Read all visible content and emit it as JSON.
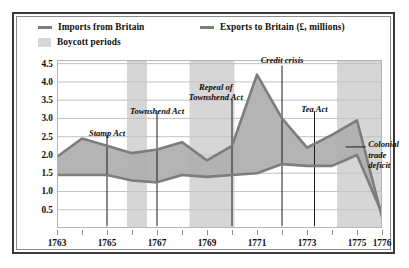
{
  "legend": {
    "imports_label": "Imports from Britain",
    "exports_label": "Exports to Britain (£, millions)",
    "boycott_label": "Boycott periods",
    "line_color": "#7d7d7d",
    "band_color": "#d6d6d6"
  },
  "annotations": [
    {
      "id": "stamp-act",
      "text": "Stamp Act"
    },
    {
      "id": "townshend-act",
      "text": "Townshend Act"
    },
    {
      "id": "repeal-line1",
      "text": "Repeal of"
    },
    {
      "id": "repeal-line2",
      "text": "Townshend Act"
    },
    {
      "id": "credit-crisis",
      "text": "Credit crisis"
    },
    {
      "id": "tea-act",
      "text": "Tea Act"
    },
    {
      "id": "colonial-line1",
      "text": "Colonial"
    },
    {
      "id": "colonial-line2",
      "text": "trade"
    },
    {
      "id": "colonial-line3",
      "text": "deficit"
    }
  ],
  "chart_data": {
    "type": "area",
    "title": "",
    "xlabel": "",
    "ylabel": "",
    "xlim": [
      1763,
      1776
    ],
    "ylim": [
      0,
      4.6
    ],
    "grid": true,
    "legend_position": "top",
    "x": [
      1763,
      1764,
      1765,
      1766,
      1767,
      1768,
      1769,
      1770,
      1771,
      1772,
      1773,
      1774,
      1775,
      1776
    ],
    "series": [
      {
        "name": "Imports from Britain",
        "color": "#7d7d7d",
        "values": [
          1.95,
          2.45,
          2.25,
          2.05,
          2.15,
          2.35,
          1.85,
          2.25,
          4.2,
          3.0,
          2.2,
          2.55,
          2.95,
          0.3
        ]
      },
      {
        "name": "Exports to Britain (£, millions)",
        "color": "#7d7d7d",
        "values": [
          1.45,
          1.45,
          1.45,
          1.3,
          1.25,
          1.45,
          1.4,
          1.45,
          1.5,
          1.75,
          1.7,
          1.7,
          2.0,
          0.4
        ]
      }
    ],
    "fill_between_color": "#b0b0b0",
    "y_ticks": [
      0.5,
      1.0,
      1.5,
      2.0,
      2.5,
      3.0,
      3.5,
      4.0,
      4.5
    ],
    "y_tick_labels": [
      "0.5",
      "1.0",
      "1.5",
      "2.0",
      "2.5",
      "3.0",
      "3.5",
      "4.0",
      "4.5"
    ],
    "x_ticks": [
      1763,
      1765,
      1767,
      1769,
      1771,
      1773,
      1775,
      1776
    ],
    "x_tick_labels": [
      "1763",
      "1765",
      "1767",
      "1769",
      "1771",
      "1773",
      "1775",
      "1776"
    ],
    "x_minor_ticks": [
      1764,
      1766,
      1768,
      1770,
      1772,
      1774
    ],
    "boycott_periods": [
      {
        "start": 1765.8,
        "end": 1766.6
      },
      {
        "start": 1768.3,
        "end": 1770.1
      },
      {
        "start": 1774.2,
        "end": 1776.0
      }
    ],
    "event_markers": [
      {
        "label": "Stamp Act",
        "year": 1765.0,
        "line_top": 2.55,
        "line_bottom": 0.05
      },
      {
        "label": "Townshend Act",
        "year": 1767.0,
        "line_top": 3.15,
        "line_bottom": 0.05
      },
      {
        "label": "Repeal of Townshend Act",
        "year": 1770.0,
        "line_top": 3.55,
        "line_bottom": 0.05
      },
      {
        "label": "Credit crisis",
        "year": 1772.0,
        "line_top": 4.45,
        "line_bottom": 0.05
      },
      {
        "label": "Tea Act",
        "year": 1773.3,
        "line_top": 3.2,
        "line_bottom": 0.05
      },
      {
        "label": "Colonial trade deficit",
        "year": 1774.8,
        "line_top": 2.0,
        "line_bottom": 2.0
      }
    ]
  }
}
